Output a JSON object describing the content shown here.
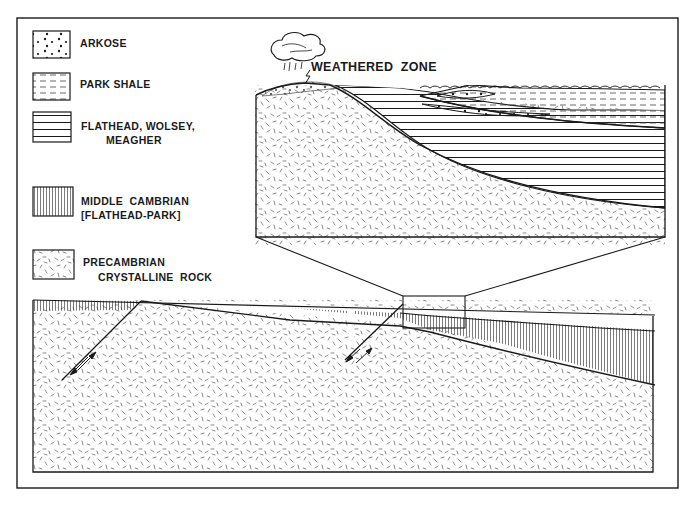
{
  "figure": {
    "type": "geologic-cross-section",
    "colors": {
      "ink": "#1a1a1a",
      "background": "#ffffff",
      "hatch": "#444444"
    }
  },
  "legend": {
    "items": [
      {
        "key": "arkose",
        "pattern": "dots",
        "lines": [
          "ARKOSE"
        ]
      },
      {
        "key": "park-shale",
        "pattern": "dashes",
        "lines": [
          "PARK SHALE"
        ]
      },
      {
        "key": "flathead-wolsey-meagher",
        "pattern": "horizontal-lines",
        "lines": [
          "FLATHEAD, WOLSEY,",
          "MEAGHER"
        ]
      },
      {
        "key": "middle-cambrian",
        "pattern": "vertical-lines",
        "lines": [
          "MIDDLE  CAMBRIAN",
          "[FLATHEAD-PARK]"
        ]
      },
      {
        "key": "precambrian",
        "pattern": "random-dashes",
        "lines": [
          "PRECAMBRIAN",
          "CRYSTALLINE  ROCK"
        ]
      }
    ]
  },
  "annotations": {
    "weathered_zone": "WEATHERED  ZONE"
  },
  "icons": {
    "cloud": "rain-cloud-icon",
    "fault_arrows": "fault-slip-arrow-icon"
  }
}
